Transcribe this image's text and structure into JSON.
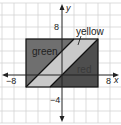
{
  "graph": {
    "x_range": [
      -10,
      10
    ],
    "y_range": [
      -8,
      10
    ],
    "grid_step": 2,
    "axes": {
      "x_label": "x",
      "y_label": "y"
    },
    "tick_labels": {
      "x_neg": "−8",
      "x_pos": "8",
      "y_pos": "8",
      "y_neg": "−4"
    },
    "rectangle": {
      "x1": -6,
      "y1": -2,
      "x2": 6,
      "y2": 6
    },
    "regions": [
      {
        "name": "green",
        "label": "green",
        "fill": "#6f6f6f",
        "points": [
          [
            -6,
            -2
          ],
          [
            2,
            6
          ],
          [
            -6,
            6
          ]
        ]
      },
      {
        "name": "yellow",
        "label": "yellow",
        "fill": "#c9c9c9",
        "points": [
          [
            -6,
            -2
          ],
          [
            -2,
            -2
          ],
          [
            6,
            6
          ],
          [
            2,
            6
          ]
        ]
      },
      {
        "name": "red",
        "label": "red",
        "fill": "#4e4e4e",
        "points": [
          [
            -2,
            -2
          ],
          [
            6,
            -2
          ],
          [
            6,
            6
          ]
        ]
      }
    ],
    "boundary_lines": [
      {
        "from": [
          -6,
          -2
        ],
        "to": [
          2,
          6
        ]
      },
      {
        "from": [
          -2,
          -2
        ],
        "to": [
          6,
          6
        ]
      }
    ]
  }
}
